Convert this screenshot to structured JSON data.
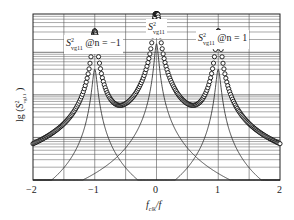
{
  "chart_data": {
    "type": "line",
    "title": "",
    "xlabel": "f_clk/f",
    "ylabel": "lg(S²_vg11)",
    "xlim": [
      -2,
      2
    ],
    "x_ticks": [
      "-2",
      "-1",
      "0",
      "1",
      "2"
    ],
    "y_scale": "log",
    "grid": true,
    "legend": null,
    "annotations": [
      {
        "text_main": "S",
        "sup": "2",
        "sub": "vg11",
        "suffix": "@n = −1",
        "near_x": -1
      },
      {
        "text_main": "S",
        "sup": "2",
        "sub": "vg11",
        "suffix": "",
        "near_x": 0
      },
      {
        "text_main": "S",
        "sup": "2",
        "sub": "vg11",
        "suffix": "@n = 1",
        "near_x": 1
      }
    ],
    "series": [
      {
        "name": "S²vg11 @n=−1",
        "style": "thin-line",
        "peak_x": -1,
        "peak_lg": 2.6,
        "width": 0.035
      },
      {
        "name": "S²vg11",
        "style": "thin-line",
        "peak_x": 0,
        "peak_lg": 3.2,
        "width": 0.03
      },
      {
        "name": "S²vg11 @n=1",
        "style": "thin-line",
        "peak_x": 1,
        "peak_lg": 2.6,
        "width": 0.035
      },
      {
        "name": "total",
        "style": "circles",
        "description": "sum of the three components"
      }
    ],
    "ylim_lg": [
      0,
      3.9
    ]
  },
  "labels": {
    "ann_left_main": "S",
    "ann_left_sup": "2",
    "ann_left_sub": "vg11",
    "ann_left_suffix": "@n = −1",
    "ann_center_main": "S",
    "ann_center_sup": "2",
    "ann_center_sub": "vg11",
    "ann_right_main": "S",
    "ann_right_sup": "2",
    "ann_right_sub": "vg11",
    "ann_right_suffix": "@n = 1",
    "xtick_0": "−2",
    "xtick_1": "−1",
    "xtick_2": "0",
    "xtick_3": "1",
    "xtick_4": "2",
    "xlabel": "f",
    "xlabel_sub": "clk",
    "xlabel_tail": "/f",
    "ylabel_pre": "lg (",
    "ylabel_main": "S",
    "ylabel_sup": "2",
    "ylabel_sub": "vg11",
    "ylabel_post": " )"
  },
  "colors": {
    "line": "#222222",
    "grid": "#555555",
    "marker": "#111111",
    "background": "#ffffff"
  }
}
